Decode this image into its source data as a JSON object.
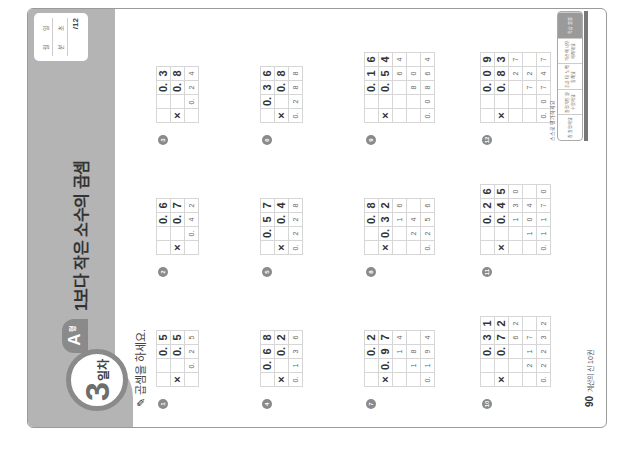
{
  "header": {
    "day_number": "3",
    "day_suffix": "일차",
    "type_letter": "A",
    "type_suffix": "형",
    "title": "1보다 작은 소수의 곱셈",
    "score_box": {
      "month_label": "월",
      "day_label": "일",
      "min_label": "분",
      "sec_label": "초",
      "score": "/12"
    }
  },
  "instruction": "곱셈을 하세요.",
  "problems": [
    {
      "num": "1",
      "rows": [
        [
          "",
          "",
          "0.",
          "5"
        ],
        [
          "×",
          "",
          "0.",
          "5"
        ]
      ],
      "answer": [
        "",
        "0.",
        "2",
        "5"
      ]
    },
    {
      "num": "2",
      "rows": [
        [
          "",
          "",
          "0.",
          "6"
        ],
        [
          "×",
          "",
          "0.",
          "7"
        ]
      ],
      "answer": [
        "",
        "0.",
        "4",
        "2"
      ]
    },
    {
      "num": "3",
      "rows": [
        [
          "",
          "",
          "0.",
          "3"
        ],
        [
          "×",
          "",
          "0.",
          "8"
        ]
      ],
      "answer": [
        "",
        "0.",
        "2",
        "4"
      ]
    },
    {
      "num": "4",
      "rows": [
        [
          "",
          "0.",
          "6",
          "8"
        ],
        [
          "×",
          "",
          "0.",
          "2"
        ]
      ],
      "answer": [
        "0.",
        "1",
        "3",
        "6"
      ]
    },
    {
      "num": "5",
      "rows": [
        [
          "",
          "0.",
          "5",
          "7"
        ],
        [
          "×",
          "",
          "0.",
          "4"
        ]
      ],
      "answer": [
        "0.",
        "2",
        "2",
        "8"
      ]
    },
    {
      "num": "6",
      "rows": [
        [
          "",
          "0.",
          "3",
          "6"
        ],
        [
          "×",
          "",
          "0.",
          "8"
        ]
      ],
      "answer": [
        "0.",
        "2",
        "8",
        "8"
      ]
    },
    {
      "num": "7",
      "rows": [
        [
          "",
          "",
          "0.",
          "2"
        ],
        [
          "×",
          "0.",
          "9",
          "7"
        ]
      ],
      "partials": [
        [
          "",
          "",
          "1",
          "4"
        ],
        [
          "",
          "1",
          "8",
          ""
        ]
      ],
      "answer": [
        "0.",
        "1",
        "9",
        "4"
      ]
    },
    {
      "num": "8",
      "rows": [
        [
          "",
          "",
          "0.",
          "8"
        ],
        [
          "×",
          "0.",
          "3",
          "2"
        ]
      ],
      "partials": [
        [
          "",
          "",
          "1",
          "6"
        ],
        [
          "",
          "2",
          "4",
          ""
        ]
      ],
      "answer": [
        "0.",
        "2",
        "5",
        "6"
      ]
    },
    {
      "num": "9",
      "rows": [
        [
          "",
          "",
          "0.",
          "1",
          "6"
        ],
        [
          "×",
          "",
          "0.",
          "5",
          "4"
        ]
      ],
      "partials": [
        [
          "",
          "",
          "",
          "6",
          "4"
        ],
        [
          "",
          "",
          "8",
          "0",
          ""
        ]
      ],
      "answer": [
        "0.",
        "0",
        "8",
        "6",
        "4"
      ]
    },
    {
      "num": "10",
      "rows": [
        [
          "",
          "",
          "0.",
          "3",
          "1"
        ],
        [
          "×",
          "",
          "0.",
          "7",
          "2"
        ]
      ],
      "partials": [
        [
          "",
          "",
          "",
          "6",
          "2"
        ],
        [
          "",
          "2",
          "1",
          "7",
          ""
        ]
      ],
      "answer": [
        "0.",
        "2",
        "2",
        "3",
        "2"
      ]
    },
    {
      "num": "11",
      "rows": [
        [
          "",
          "",
          "0.",
          "2",
          "6"
        ],
        [
          "×",
          "",
          "0.",
          "4",
          "5"
        ]
      ],
      "partials": [
        [
          "",
          "",
          "1",
          "3",
          "0"
        ],
        [
          "",
          "1",
          "0",
          "4",
          ""
        ]
      ],
      "answer": [
        "0.",
        "1",
        "1",
        "7",
        "0"
      ]
    },
    {
      "num": "12",
      "rows": [
        [
          "",
          "",
          "0.",
          "0",
          "9"
        ],
        [
          "×",
          "",
          "0.",
          "8",
          "3"
        ]
      ],
      "partials": [
        [
          "",
          "",
          "",
          "2",
          "7"
        ],
        [
          "",
          "",
          "7",
          "2",
          ""
        ]
      ],
      "answer": [
        "0.",
        "0",
        "7",
        "4",
        "7"
      ]
    }
  ],
  "footer": {
    "page": "90",
    "book": "계산의 신 10권"
  },
  "rating": {
    "label": "스스로 평가하세요",
    "options": [
      "참 잘했어요",
      "잘했지만 실수했어요",
      "조금 더 노력 할래요",
      "계산이 너무 어려워요",
      "학습 일일"
    ]
  }
}
